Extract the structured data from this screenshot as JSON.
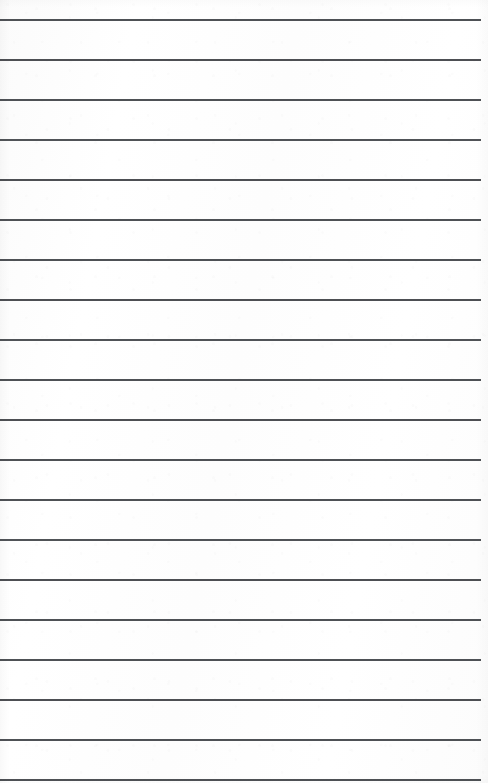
{
  "document": {
    "kind": "scanned-ruled-notebook-page",
    "title": "Blank ruled page",
    "content_text": "",
    "width_px": 488,
    "height_px": 783
  },
  "paper": {
    "background_color": "#fdfdfd",
    "edge_color": "#f7f7f7",
    "has_margin_rule": false,
    "has_header_text": false,
    "has_handwriting": false
  },
  "ruling": {
    "line_color": "#3f4246",
    "line_thickness_px": 2,
    "line_spacing_px": 40,
    "first_line_y_px": 19,
    "last_line_y_px": 779,
    "line_start_x_px": 0,
    "line_end_x_px": 481,
    "right_margin_px": 7,
    "line_count": 20,
    "lines": [
      {
        "index": 1,
        "y": 19,
        "x_start": 0,
        "x_end": 481,
        "opacity": 0.92,
        "text": ""
      },
      {
        "index": 2,
        "y": 59,
        "x_start": 0,
        "x_end": 481,
        "opacity": 0.93,
        "text": ""
      },
      {
        "index": 3,
        "y": 99,
        "x_start": 0,
        "x_end": 481,
        "opacity": 0.92,
        "text": ""
      },
      {
        "index": 4,
        "y": 139,
        "x_start": 0,
        "x_end": 481,
        "opacity": 0.91,
        "text": ""
      },
      {
        "index": 5,
        "y": 179,
        "x_start": 0,
        "x_end": 481,
        "opacity": 0.93,
        "text": ""
      },
      {
        "index": 6,
        "y": 219,
        "x_start": 0,
        "x_end": 481,
        "opacity": 0.92,
        "text": ""
      },
      {
        "index": 7,
        "y": 259,
        "x_start": 0,
        "x_end": 481,
        "opacity": 0.92,
        "text": ""
      },
      {
        "index": 8,
        "y": 299,
        "x_start": 0,
        "x_end": 481,
        "opacity": 0.93,
        "text": ""
      },
      {
        "index": 9,
        "y": 339,
        "x_start": 0,
        "x_end": 481,
        "opacity": 0.91,
        "text": ""
      },
      {
        "index": 10,
        "y": 379,
        "x_start": 0,
        "x_end": 481,
        "opacity": 0.92,
        "text": ""
      },
      {
        "index": 11,
        "y": 419,
        "x_start": 0,
        "x_end": 481,
        "opacity": 0.93,
        "text": ""
      },
      {
        "index": 12,
        "y": 459,
        "x_start": 0,
        "x_end": 481,
        "opacity": 0.92,
        "text": ""
      },
      {
        "index": 13,
        "y": 499,
        "x_start": 0,
        "x_end": 481,
        "opacity": 0.92,
        "text": ""
      },
      {
        "index": 14,
        "y": 539,
        "x_start": 0,
        "x_end": 481,
        "opacity": 0.91,
        "text": ""
      },
      {
        "index": 15,
        "y": 579,
        "x_start": 0,
        "x_end": 481,
        "opacity": 0.93,
        "text": ""
      },
      {
        "index": 16,
        "y": 619,
        "x_start": 0,
        "x_end": 481,
        "opacity": 0.92,
        "text": ""
      },
      {
        "index": 17,
        "y": 659,
        "x_start": 0,
        "x_end": 481,
        "opacity": 0.92,
        "text": ""
      },
      {
        "index": 18,
        "y": 699,
        "x_start": 0,
        "x_end": 481,
        "opacity": 0.93,
        "text": ""
      },
      {
        "index": 19,
        "y": 739,
        "x_start": 0,
        "x_end": 481,
        "opacity": 0.92,
        "text": ""
      },
      {
        "index": 20,
        "y": 779,
        "x_start": 0,
        "x_end": 481,
        "opacity": 0.92,
        "text": ""
      }
    ]
  }
}
